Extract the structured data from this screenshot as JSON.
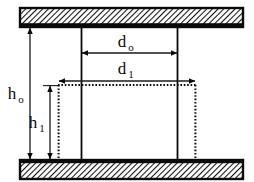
{
  "diagram": {
    "colors": {
      "stroke": "#0a0a0a",
      "hatch": "#111111",
      "background": "#ffffff",
      "dimension_line": "#1a1a1a"
    },
    "labels": {
      "height_outer": {
        "base": "h",
        "sub": "o",
        "full": "h_o"
      },
      "height_inner": {
        "base": "h",
        "sub": "1",
        "full": "h_1"
      },
      "diameter_outer": {
        "base": "d",
        "sub": "o",
        "full": "d_o"
      },
      "diameter_inner": {
        "base": "d",
        "sub": "1",
        "full": "d_1"
      }
    },
    "parts": {
      "top_plate": "top-hatched-plate",
      "bottom_plate": "bottom-hatched-plate",
      "solid_column": "solid-column-outline",
      "dotted_column": "dotted-column-outline"
    },
    "geometry": {
      "top_plate": {
        "x": 20,
        "y": 8,
        "width": 223,
        "height": 19
      },
      "bottom_plate": {
        "x": 20,
        "y": 160,
        "width": 223,
        "height": 19
      },
      "solid_column": {
        "left": 81,
        "right": 178,
        "top": 26,
        "bottom": 161
      },
      "dotted_column": {
        "left": 58,
        "right": 196,
        "top": 85,
        "bottom": 162
      },
      "h_outer_arrow": {
        "x": 30,
        "y_top": 27,
        "y_bottom": 160
      },
      "h_inner_arrow": {
        "x": 50,
        "y_top": 85,
        "y_bottom": 160
      },
      "d_outer_arrow": {
        "y": 53,
        "x_left": 81,
        "x_right": 178
      },
      "d_inner_arrow": {
        "y": 81,
        "x_left": 58,
        "x_right": 196
      }
    }
  }
}
